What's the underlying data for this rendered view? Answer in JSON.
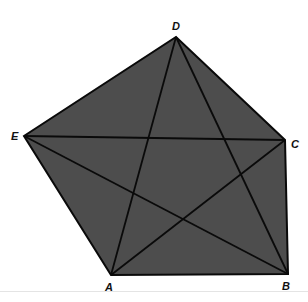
{
  "diagram": {
    "type": "pentagon-with-diagonals",
    "fill_color": "#4d4d4d",
    "stroke_color": "#0a0a0a",
    "vertices": [
      {
        "label": "A",
        "x": 111,
        "y": 275
      },
      {
        "label": "B",
        "x": 288,
        "y": 274
      },
      {
        "label": "C",
        "x": 285,
        "y": 140
      },
      {
        "label": "D",
        "x": 176,
        "y": 37
      },
      {
        "label": "E",
        "x": 24,
        "y": 136
      }
    ],
    "labels": {
      "A": "A",
      "B": "B",
      "C": "C",
      "D": "D",
      "E": "E"
    }
  }
}
